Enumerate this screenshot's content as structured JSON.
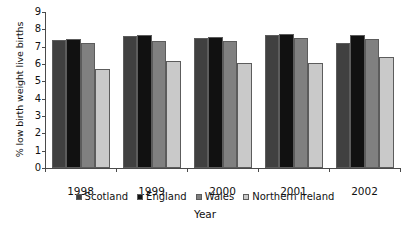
{
  "chart_data": {
    "type": "bar",
    "title": "",
    "xlabel": "Year",
    "ylabel": "% low birth weight live births",
    "categories": [
      "1998",
      "1999",
      "2000",
      "2001",
      "2002"
    ],
    "ylim": [
      0,
      9
    ],
    "yticks": [
      "0",
      "1",
      "2",
      "3",
      "4",
      "5",
      "6",
      "7",
      "8",
      "9"
    ],
    "grid": false,
    "legend_position": "bottom",
    "series": [
      {
        "name": "Scotland",
        "color": "#404040",
        "values": [
          7.4,
          7.6,
          7.5,
          7.7,
          7.2
        ]
      },
      {
        "name": "England",
        "color": "#111111",
        "values": [
          7.45,
          7.65,
          7.55,
          7.75,
          7.7
        ]
      },
      {
        "name": "Wales",
        "color": "#808080",
        "values": [
          7.2,
          7.3,
          7.35,
          7.5,
          7.45
        ]
      },
      {
        "name": "Northern Ireland",
        "color": "#c9c9c9",
        "values": [
          5.7,
          6.2,
          6.05,
          6.05,
          6.4
        ]
      }
    ]
  }
}
